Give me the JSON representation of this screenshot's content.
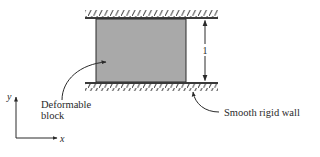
{
  "figure": {
    "type": "mechanics-schematic",
    "colors": {
      "background": "#ffffff",
      "block_fill": "#a9a9a9",
      "line": "#2a2a2a",
      "wall": "#3a3a3a"
    },
    "block": {
      "label_line1": "Deformable",
      "label_line2": "block"
    },
    "wall": {
      "label": "Smooth rigid wall"
    },
    "dimension": {
      "label": "1"
    },
    "axes": {
      "x_label": "x",
      "y_label": "y"
    }
  }
}
